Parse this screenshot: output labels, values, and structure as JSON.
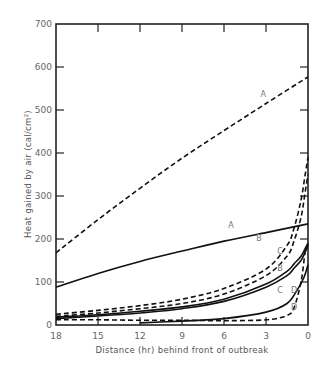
{
  "chart_data": {
    "type": "line",
    "title": "",
    "xlabel": "Distance (hr) behind front of outbreak",
    "ylabel": "Heat gained by air (cal/cm²)",
    "xlim": [
      18,
      0
    ],
    "ylim": [
      0,
      700
    ],
    "x_ticks": [
      18,
      15,
      12,
      9,
      6,
      3,
      0
    ],
    "y_ticks": [
      0,
      100,
      200,
      300,
      400,
      500,
      600,
      700
    ],
    "grid": false,
    "legend": "none (curves labeled inline)",
    "series": [
      {
        "name": "A",
        "style": "dashed",
        "x": [
          18,
          15,
          12,
          9,
          6,
          3,
          0
        ],
        "y": [
          168,
          245,
          318,
          388,
          452,
          515,
          577
        ]
      },
      {
        "name": "A",
        "style": "solid",
        "x": [
          18,
          15,
          12,
          9,
          6,
          3,
          0
        ],
        "y": [
          88,
          120,
          148,
          172,
          195,
          215,
          235
        ]
      },
      {
        "name": "B",
        "style": "dashed",
        "x": [
          18,
          15,
          12,
          9,
          6,
          3,
          1.5,
          1,
          0.5,
          0.2,
          0
        ],
        "y": [
          25,
          34,
          45,
          60,
          85,
          130,
          185,
          225,
          290,
          350,
          390
        ]
      },
      {
        "name": "C",
        "style": "dashed",
        "x": [
          18,
          15,
          12,
          9,
          6,
          3,
          1.5,
          1,
          0.5,
          0.2,
          0
        ],
        "y": [
          20,
          28,
          38,
          50,
          72,
          115,
          160,
          195,
          250,
          310,
          350
        ]
      },
      {
        "name": "B",
        "style": "solid",
        "x": [
          18,
          15,
          12,
          9,
          6,
          3,
          1.5,
          1,
          0.5,
          0.2,
          0
        ],
        "y": [
          18,
          24,
          32,
          42,
          60,
          95,
          125,
          142,
          160,
          178,
          190
        ]
      },
      {
        "name": "C",
        "style": "solid",
        "x": [
          18,
          15,
          12,
          9,
          6,
          3,
          1.5,
          1,
          0.5,
          0.2,
          0
        ],
        "y": [
          15,
          21,
          28,
          38,
          55,
          88,
          115,
          132,
          150,
          170,
          185
        ]
      },
      {
        "name": "D",
        "style": "dashed",
        "x": [
          18,
          15,
          12,
          9,
          6,
          3,
          1.5,
          1,
          0.5,
          0.2,
          0
        ],
        "y": [
          12,
          12,
          11,
          11,
          10,
          12,
          22,
          40,
          100,
          170,
          190
        ]
      },
      {
        "name": "D",
        "style": "solid",
        "x": [
          12,
          9,
          6,
          3,
          1.5,
          0.8,
          0.3,
          0
        ],
        "y": [
          5,
          9,
          15,
          30,
          50,
          80,
          110,
          140
        ]
      }
    ],
    "annotations": [
      {
        "text": "A",
        "x": 3.2,
        "y": 530
      },
      {
        "text": "A",
        "x": 5.5,
        "y": 225
      },
      {
        "text": "B",
        "x": 3.5,
        "y": 195
      },
      {
        "text": "C",
        "x": 2.0,
        "y": 165
      },
      {
        "text": "B",
        "x": 2.0,
        "y": 125
      },
      {
        "text": "C",
        "x": 2.0,
        "y": 75
      },
      {
        "text": "D",
        "x": 1.0,
        "y": 75
      },
      {
        "text": "D",
        "x": 1.0,
        "y": 35
      }
    ]
  }
}
